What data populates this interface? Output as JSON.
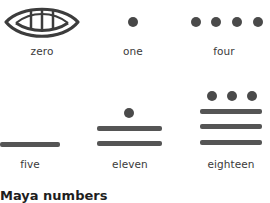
{
  "title": "Maya numbers",
  "colors": {
    "glyph": "#4a4a4a",
    "label": "#3a3a3a",
    "title": "#1e1e1e",
    "background": "#ffffff"
  },
  "numerals": [
    {
      "label": "zero",
      "value": 0,
      "glyph": "shell-icon",
      "dots": 0,
      "bars": 0
    },
    {
      "label": "one",
      "value": 1,
      "glyph": "dot",
      "dots": 1,
      "bars": 0
    },
    {
      "label": "four",
      "value": 4,
      "glyph": "dots",
      "dots": 4,
      "bars": 0
    },
    {
      "label": "five",
      "value": 5,
      "glyph": "bar",
      "dots": 0,
      "bars": 1
    },
    {
      "label": "eleven",
      "value": 11,
      "glyph": "dots-bars",
      "dots": 1,
      "bars": 2
    },
    {
      "label": "eighteen",
      "value": 18,
      "glyph": "dots-bars",
      "dots": 3,
      "bars": 3
    }
  ]
}
